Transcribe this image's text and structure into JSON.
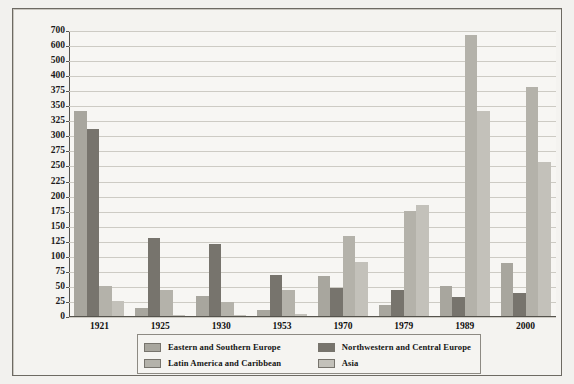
{
  "chart_data": {
    "type": "bar",
    "title": "",
    "xlabel": "",
    "ylabel": "Numbers in thousands",
    "categories": [
      "1921",
      "1925",
      "1930",
      "1953",
      "1970",
      "1979",
      "1989",
      "2000"
    ],
    "ytick_labels": [
      "700",
      "600",
      "500",
      "400",
      "375",
      "350",
      "325",
      "300",
      "275",
      "250",
      "225",
      "200",
      "175",
      "150",
      "125",
      "100",
      "75",
      "50",
      "25",
      "0"
    ],
    "ytick_values": [
      700,
      600,
      500,
      400,
      375,
      350,
      325,
      300,
      275,
      250,
      225,
      200,
      175,
      150,
      125,
      100,
      75,
      50,
      25,
      0
    ],
    "ylim": [
      0,
      700
    ],
    "grid": true,
    "legend_position": "bottom",
    "series": [
      {
        "name": "Eastern and Southern Europe",
        "color": "#a8a69e",
        "values": [
          340,
          13,
          33,
          10,
          67,
          19,
          50,
          88
        ]
      },
      {
        "name": "Northwestern and Central Europe",
        "color": "#77746d",
        "values": [
          310,
          130,
          119,
          68,
          46,
          44,
          31,
          38
        ]
      },
      {
        "name": "Latin America and Caribbean",
        "color": "#b4b2aa",
        "values": [
          50,
          43,
          23,
          44,
          133,
          174,
          665,
          380
        ]
      },
      {
        "name": "Asia",
        "color": "#c3c1ba",
        "values": [
          25,
          2,
          2,
          4,
          89,
          184,
          340,
          255
        ]
      }
    ]
  },
  "legend": {
    "items": [
      {
        "label": "Eastern and Southern Europe",
        "color": "#a8a69e"
      },
      {
        "label": "Northwestern and Central Europe",
        "color": "#77746d"
      },
      {
        "label": "Latin America and Caribbean",
        "color": "#b4b2aa"
      },
      {
        "label": "Asia",
        "color": "#c3c1ba"
      }
    ]
  }
}
